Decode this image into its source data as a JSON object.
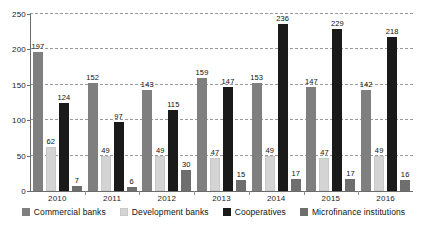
{
  "chart_data": {
    "type": "bar",
    "title": "",
    "subtitle": "",
    "xlabel": "",
    "ylabel": "",
    "ylim": [
      0,
      250
    ],
    "yticks": [
      0,
      50,
      100,
      150,
      200,
      250
    ],
    "grid": true,
    "legend_position": "bottom",
    "categories": [
      "2010",
      "2011",
      "2012",
      "2013",
      "2014",
      "2015",
      "2016"
    ],
    "series": [
      {
        "name": "Commercial banks",
        "color": "#7f7f7f",
        "values": [
          197,
          152,
          143,
          159,
          153,
          147,
          142
        ]
      },
      {
        "name": "Development banks",
        "color": "#d4d4d4",
        "values": [
          62,
          49,
          49,
          47,
          49,
          47,
          49
        ]
      },
      {
        "name": "Cooperatives",
        "color": "#1a1a1a",
        "values": [
          124,
          97,
          115,
          147,
          236,
          229,
          218
        ]
      },
      {
        "name": "Microfinance institutions",
        "color": "#6e6e6e",
        "values": [
          7,
          6,
          30,
          15,
          17,
          17,
          16
        ]
      }
    ]
  },
  "axis": {
    "y_tick_labels": [
      "0",
      "50",
      "100",
      "150",
      "200",
      "250"
    ],
    "x_tick_labels": [
      "2010",
      "2011",
      "2012",
      "2013",
      "2014",
      "2015",
      "2016"
    ]
  },
  "legend": {
    "items": [
      {
        "label": "Commercial banks",
        "color": "#7f7f7f"
      },
      {
        "label": "Development banks",
        "color": "#d4d4d4"
      },
      {
        "label": "Cooperatives",
        "color": "#1a1a1a"
      },
      {
        "label": "Microfinance institutions",
        "color": "#6e6e6e"
      }
    ]
  },
  "colors": {
    "background": "#ffffff",
    "axis": "#6b6b6b",
    "gridline": "#9a9a9a",
    "text": "#111111"
  }
}
